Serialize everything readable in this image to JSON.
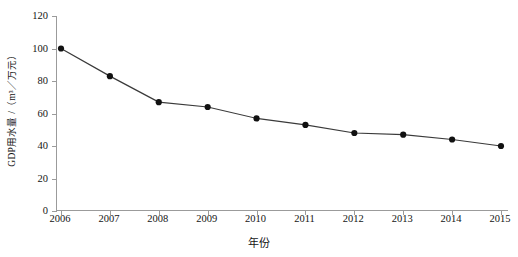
{
  "chart_data": {
    "type": "line",
    "title": "",
    "subtitle": "",
    "xlabel": "年份",
    "ylabel": "GDP用水量 /（m³／万元）",
    "categories": [
      "2006",
      "2007",
      "2008",
      "2009",
      "2010",
      "2011",
      "2012",
      "2013",
      "2014",
      "2015"
    ],
    "x": [
      2006,
      2007,
      2008,
      2009,
      2010,
      2011,
      2012,
      2013,
      2014,
      2015
    ],
    "values": [
      100,
      83,
      67,
      64,
      57,
      53,
      48,
      47,
      44,
      40
    ],
    "series": [
      {
        "name": "GDP用水量",
        "values": [
          100,
          83,
          67,
          64,
          57,
          53,
          48,
          47,
          44,
          40
        ]
      }
    ],
    "ylim": [
      0,
      120
    ],
    "yticks": [
      0,
      20,
      40,
      60,
      80,
      100,
      120
    ],
    "ytick_labels": [
      "0",
      "20",
      "40",
      "60",
      "80",
      "100",
      "120"
    ],
    "xlim": [
      2006,
      2015
    ],
    "grid": false,
    "legend": false,
    "legend_position": "none",
    "marker": "filled-circle",
    "line_color": "#3a3a3a",
    "marker_color": "#111111",
    "axis_color": "#9b9b9b",
    "background_color": "#ffffff"
  }
}
